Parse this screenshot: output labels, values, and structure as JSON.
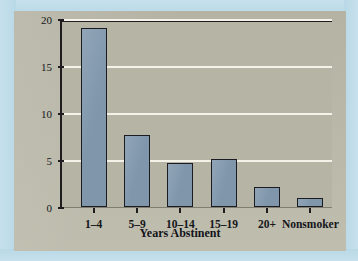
{
  "chart_data": {
    "type": "bar",
    "title": "",
    "xlabel": "Years Abstinent",
    "ylabel": "Mortality Ratio",
    "categories": [
      "1–4",
      "5–9",
      "10–14",
      "15–19",
      "20+",
      "Nonsmoker"
    ],
    "values": [
      19.0,
      7.7,
      4.7,
      5.1,
      2.1,
      1.0
    ],
    "ylim": [
      0,
      20
    ],
    "yticks": [
      0,
      5,
      10,
      15,
      20
    ],
    "ytick_labels": [
      "0",
      "5",
      "10",
      "15",
      "20"
    ],
    "grid": "horizontal-only",
    "legend": "none"
  },
  "style": {
    "bar_fill": "#7f96ab",
    "bar_outline": "#1b1c21",
    "plot_background": "#b6b5a5",
    "panel_background": "#bab9a9",
    "outer_background": "#bcdbe8",
    "gridline_color": "#f4f3ea",
    "axis_color": "#1d1d1f",
    "text_color": "#15151a"
  }
}
